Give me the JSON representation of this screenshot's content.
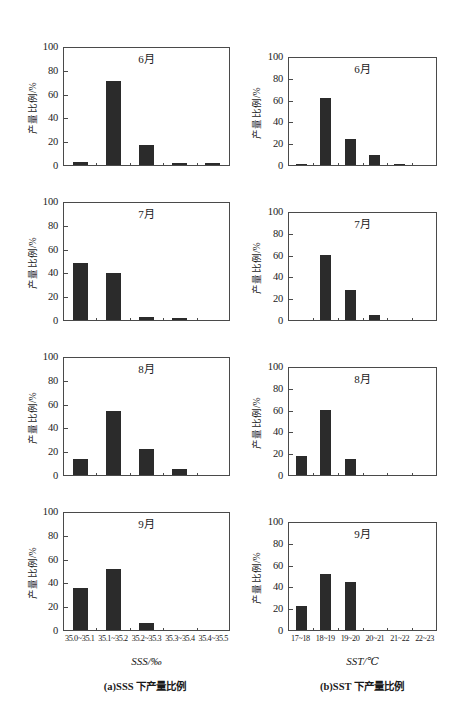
{
  "figure": {
    "width": 463,
    "height": 717,
    "background": "#ffffff",
    "bar_color": "#2b2b2b",
    "axis_color": "#4a4a4a"
  },
  "chart_data": [
    {
      "type": "bar",
      "panel": "a",
      "title": "6月",
      "xlabel": "SSS/‰",
      "ylabel": "产量比例/%",
      "categories": [
        "35.0~35.1",
        "35.1~35.2",
        "35.2~35.3",
        "35.3~35.4",
        "35.4~35.5"
      ],
      "values": [
        3,
        72,
        17,
        1,
        1
      ],
      "ylim": [
        0,
        100
      ],
      "yticks": [
        0,
        20,
        40,
        60,
        80,
        100
      ],
      "grid": false,
      "legend": "none"
    },
    {
      "type": "bar",
      "panel": "a",
      "title": "7月",
      "xlabel": "SSS/‰",
      "ylabel": "产量比例/%",
      "categories": [
        "35.0~35.1",
        "35.1~35.2",
        "35.2~35.3",
        "35.3~35.4",
        "35.4~35.5"
      ],
      "values": [
        49,
        40,
        3,
        1,
        0
      ],
      "ylim": [
        0,
        100
      ],
      "yticks": [
        0,
        20,
        40,
        60,
        80,
        100
      ],
      "grid": false,
      "legend": "none"
    },
    {
      "type": "bar",
      "panel": "a",
      "title": "8月",
      "xlabel": "SSS/‰",
      "ylabel": "产量比例/%",
      "categories": [
        "35.0~35.1",
        "35.1~35.2",
        "35.2~35.3",
        "35.3~35.4",
        "35.4~35.5"
      ],
      "values": [
        14,
        55,
        22,
        5,
        0
      ],
      "ylim": [
        0,
        100
      ],
      "yticks": [
        0,
        20,
        40,
        60,
        80,
        100
      ],
      "grid": false,
      "legend": "none"
    },
    {
      "type": "bar",
      "panel": "a",
      "title": "9月",
      "xlabel": "SSS/‰",
      "ylabel": "产量比例/%",
      "categories": [
        "35.0~35.1",
        "35.1~35.2",
        "35.2~35.3",
        "35.3~35.4",
        "35.4~35.5"
      ],
      "values": [
        36,
        52,
        6,
        0,
        0
      ],
      "ylim": [
        0,
        100
      ],
      "yticks": [
        0,
        20,
        40,
        60,
        80,
        100
      ],
      "grid": false,
      "legend": "none"
    },
    {
      "type": "bar",
      "panel": "b",
      "title": "6月",
      "xlabel": "SST/℃",
      "ylabel": "产量比例/%",
      "categories": [
        "17~18",
        "18~19",
        "19~20",
        "20~21",
        "21~22",
        "22~23"
      ],
      "values": [
        1,
        63,
        24,
        9,
        1,
        0
      ],
      "ylim": [
        0,
        100
      ],
      "yticks": [
        0,
        20,
        40,
        60,
        80,
        100
      ],
      "grid": false,
      "legend": "none"
    },
    {
      "type": "bar",
      "panel": "b",
      "title": "7月",
      "xlabel": "SST/℃",
      "ylabel": "产量比例/%",
      "categories": [
        "17~18",
        "18~19",
        "19~20",
        "20~21",
        "21~22",
        "22~23"
      ],
      "values": [
        0,
        61,
        28,
        5,
        0,
        0
      ],
      "ylim": [
        0,
        100
      ],
      "yticks": [
        0,
        20,
        40,
        60,
        80,
        100
      ],
      "grid": false,
      "legend": "none"
    },
    {
      "type": "bar",
      "panel": "b",
      "title": "8月",
      "xlabel": "SST/℃",
      "ylabel": "产量比例/%",
      "categories": [
        "17~18",
        "18~19",
        "19~20",
        "20~21",
        "21~22",
        "22~23"
      ],
      "values": [
        18,
        61,
        15,
        0,
        0,
        0
      ],
      "ylim": [
        0,
        100
      ],
      "yticks": [
        0,
        20,
        40,
        60,
        80,
        100
      ],
      "grid": false,
      "legend": "none"
    },
    {
      "type": "bar",
      "panel": "b",
      "title": "9月",
      "xlabel": "SST/℃",
      "ylabel": "产量比例/%",
      "categories": [
        "17~18",
        "18~19",
        "19~20",
        "20~21",
        "21~22",
        "22~23"
      ],
      "values": [
        22,
        52,
        45,
        0,
        0,
        0
      ],
      "ylim": [
        0,
        100
      ],
      "yticks": [
        0,
        20,
        40,
        60,
        80,
        100
      ],
      "grid": false,
      "legend": "none"
    }
  ],
  "columns": {
    "a": {
      "axis_title": "SSS/‰",
      "caption": "(a)SSS 下产量比例",
      "ylabel": "产量比例/%",
      "xticklabels": [
        "35.0~35.1",
        "35.1~35.2",
        "35.2~35.3",
        "35.3~35.4",
        "35.4~35.5"
      ],
      "yticklabels": [
        "0",
        "20",
        "40",
        "60",
        "80",
        "100"
      ],
      "months": [
        "6月",
        "7月",
        "8月",
        "9月"
      ]
    },
    "b": {
      "axis_title": "SST/℃",
      "caption": "(b)SST 下产量比例",
      "ylabel": "产量比例/%",
      "xticklabels": [
        "17~18",
        "18~19",
        "19~20",
        "20~21",
        "21~22",
        "22~23"
      ],
      "yticklabels": [
        "0",
        "20",
        "40",
        "60",
        "80",
        "100"
      ],
      "months": [
        "6月",
        "7月",
        "8月",
        "9月"
      ]
    }
  }
}
